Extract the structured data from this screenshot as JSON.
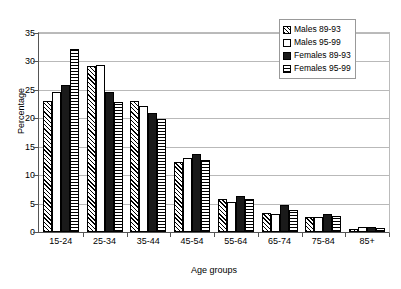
{
  "chart_data": {
    "type": "bar",
    "title": "",
    "xlabel": "Age groups",
    "ylabel": "Percentage",
    "ylim": [
      0,
      35
    ],
    "yticks": [
      0,
      5,
      10,
      15,
      20,
      25,
      30,
      35
    ],
    "grid": true,
    "legend_position": "top-right",
    "categories": [
      "15-24",
      "25-34",
      "35-44",
      "45-54",
      "55-64",
      "65-74",
      "75-84",
      "85+"
    ],
    "series": [
      {
        "name": "Males 89-93",
        "pattern": "diagonal-hatch",
        "values": [
          23.0,
          29.2,
          23.0,
          12.4,
          5.8,
          3.4,
          2.7,
          0.6
        ]
      },
      {
        "name": "Males 95-99",
        "pattern": "white-empty",
        "values": [
          24.7,
          29.3,
          22.2,
          13.1,
          5.2,
          3.1,
          2.6,
          0.9
        ]
      },
      {
        "name": "Females 89-93",
        "pattern": "solid-black",
        "values": [
          25.8,
          24.6,
          21.0,
          13.7,
          6.4,
          4.8,
          3.2,
          0.8
        ]
      },
      {
        "name": "Females 95-99",
        "pattern": "horizontal-lines",
        "values": [
          32.2,
          22.9,
          19.9,
          12.6,
          5.8,
          3.8,
          2.8,
          0.7
        ]
      }
    ]
  }
}
